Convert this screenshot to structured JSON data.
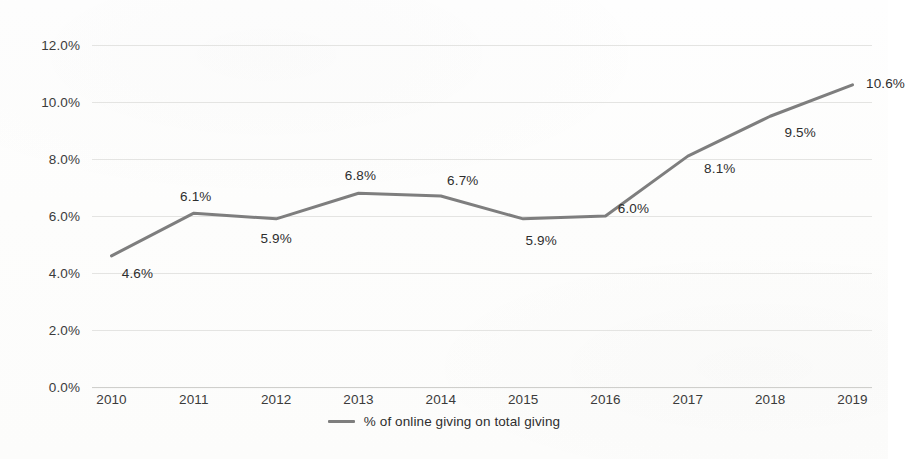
{
  "chart_data": {
    "type": "line",
    "title": "",
    "subtitle": "",
    "xlabel": "",
    "ylabel": "",
    "categories": [
      "2010",
      "2011",
      "2012",
      "2013",
      "2014",
      "2015",
      "2016",
      "2017",
      "2018",
      "2019"
    ],
    "values": [
      4.6,
      6.1,
      5.9,
      6.8,
      6.7,
      5.9,
      6.0,
      8.1,
      9.5,
      10.6
    ],
    "series": [
      {
        "name": "% of online giving on total giving",
        "values": [
          4.6,
          6.1,
          5.9,
          6.8,
          6.7,
          5.9,
          6.0,
          8.1,
          9.5,
          10.6
        ],
        "color": "#7e7e7e"
      }
    ],
    "point_labels": [
      "4.6%",
      "6.1%",
      "5.9%",
      "6.8%",
      "6.7%",
      "5.9%",
      "6.0%",
      "8.1%",
      "9.5%",
      "10.6%"
    ],
    "ylim": [
      0,
      12
    ],
    "ytick_values": [
      12.0,
      10.0,
      8.0,
      6.0,
      4.0,
      2.0,
      0.0
    ],
    "ytick_labels": [
      "12.0%",
      "10.0%",
      "8.0%",
      "6.0%",
      "4.0%",
      "2.0%",
      "0.0%"
    ],
    "grid": true,
    "grid_axis": "y",
    "legend_position": "bottom",
    "legend_entries": [
      "% of online giving on total giving"
    ],
    "line_color": "#7e7e7e",
    "grid_color": "#e4e4e2",
    "text_color": "#2e2e2e",
    "background_color": "#fdfdfc"
  },
  "legend": {
    "label": "% of online giving on total giving",
    "marker": "line-marker-icon"
  }
}
